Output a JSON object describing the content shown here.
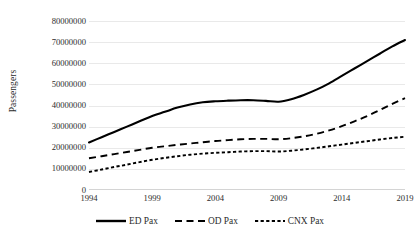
{
  "chart_data": {
    "type": "line",
    "title": "",
    "xlabel": "",
    "ylabel": "Passengers",
    "grid": true,
    "legend_position": "bottom",
    "xlim": [
      1994,
      2019
    ],
    "ylim": [
      0,
      80000000
    ],
    "x": [
      1994,
      1995,
      1996,
      1997,
      1998,
      1999,
      2000,
      2001,
      2002,
      2003,
      2004,
      2005,
      2006,
      2007,
      2008,
      2009,
      2010,
      2011,
      2012,
      2013,
      2014,
      2015,
      2016,
      2017,
      2018,
      2019
    ],
    "x_tick_labels": [
      "1994",
      "1999",
      "2004",
      "2009",
      "2014",
      "2019"
    ],
    "x_tick_values": [
      1994,
      1999,
      2004,
      2009,
      2014,
      2019
    ],
    "y_tick_labels": [
      "0",
      "10000000",
      "20000000",
      "30000000",
      "40000000",
      "50000000",
      "60000000",
      "70000000",
      "80000000"
    ],
    "y_tick_values": [
      0,
      10000000,
      20000000,
      30000000,
      40000000,
      50000000,
      60000000,
      70000000,
      80000000
    ],
    "series": [
      {
        "name": "ED Pax",
        "style": "solid",
        "color": "#000000",
        "values": [
          22500000,
          25000000,
          27500000,
          30000000,
          32500000,
          35000000,
          37000000,
          39000000,
          40500000,
          41500000,
          42000000,
          42300000,
          42500000,
          42500000,
          42200000,
          41800000,
          43000000,
          45000000,
          47500000,
          50500000,
          54000000,
          57500000,
          61000000,
          64500000,
          68000000,
          71000000
        ]
      },
      {
        "name": "OD Pax",
        "style": "dashed",
        "color": "#000000",
        "values": [
          15000000,
          16000000,
          17000000,
          18000000,
          19000000,
          20000000,
          20700000,
          21400000,
          22000000,
          22600000,
          23200000,
          23600000,
          24000000,
          24200000,
          24200000,
          24000000,
          24500000,
          25400000,
          26600000,
          28200000,
          30200000,
          32500000,
          35000000,
          37800000,
          40800000,
          43500000
        ]
      },
      {
        "name": "CNX Pax",
        "style": "dotted",
        "color": "#000000",
        "values": [
          8500000,
          9700000,
          10900000,
          12000000,
          13200000,
          14300000,
          15200000,
          16000000,
          16700000,
          17200000,
          17600000,
          17900000,
          18200000,
          18400000,
          18400000,
          18200000,
          18600000,
          19200000,
          19900000,
          20700000,
          21500000,
          22300000,
          23100000,
          23900000,
          24600000,
          25200000
        ]
      }
    ]
  },
  "legend": {
    "items": [
      {
        "label": "ED Pax",
        "style": "solid"
      },
      {
        "label": "OD Pax",
        "style": "dashed"
      },
      {
        "label": "CNX Pax",
        "style": "dotted"
      }
    ]
  }
}
